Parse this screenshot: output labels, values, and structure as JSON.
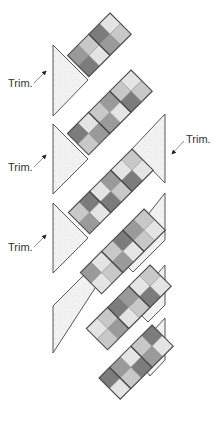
{
  "diagram": {
    "square_step": 10.6,
    "colors": {
      "background": "#ffffff",
      "triangle_fill": "#f1f1f1",
      "triangle_stroke": "#555555",
      "square_stroke": "#4a4a4a",
      "shades": [
        "#e4e4e4",
        "#c8c8c8",
        "#9a9a9a",
        "#7c7c7c"
      ],
      "label": "#333333",
      "arrow": "#333333"
    },
    "pieces": [
      {
        "name": "setting-triangle-left-1",
        "points": [
          [
            53,
            45
          ],
          [
            88,
            80
          ],
          [
            53,
            116
          ]
        ]
      },
      {
        "name": "setting-triangle-left-2",
        "points": [
          [
            53,
            124
          ],
          [
            67,
            138
          ],
          [
            88,
            159
          ],
          [
            53,
            194
          ]
        ]
      },
      {
        "name": "setting-triangle-right-1",
        "points": [
          [
            165,
            114
          ],
          [
            165,
            183
          ],
          [
            132,
            149
          ]
        ]
      },
      {
        "name": "setting-triangle-left-3",
        "points": [
          [
            53,
            203
          ],
          [
            88,
            238
          ],
          [
            53,
            273
          ]
        ]
      },
      {
        "name": "setting-parallelogram-right-2",
        "points": [
          [
            165,
            193
          ],
          [
            165,
            240
          ],
          [
            133,
            272
          ],
          [
            116,
            255
          ]
        ]
      },
      {
        "name": "setting-parallelogram-left-4",
        "points": [
          [
            53,
            306
          ],
          [
            88,
            271
          ],
          [
            99,
            282
          ],
          [
            53,
            353
          ]
        ]
      },
      {
        "name": "setting-parallelogram-right-3",
        "points": [
          [
            165,
            265
          ],
          [
            165,
            305
          ],
          [
            148,
            322
          ],
          [
            131,
            305
          ]
        ]
      },
      {
        "name": "setting-parallelogram-right-4",
        "points": [
          [
            165,
            318
          ],
          [
            165,
            360
          ],
          [
            150,
            376
          ],
          [
            133,
            353
          ]
        ]
      }
    ],
    "strips": [
      {
        "name": "strip-1",
        "top": [
          110,
          13
        ],
        "rows": [
          [
            0,
            1
          ],
          [
            3,
            2
          ],
          [
            1,
            0
          ],
          [
            2,
            3
          ]
        ]
      },
      {
        "name": "strip-2",
        "top": [
          131,
          70
        ],
        "rows": [
          [
            0,
            1
          ],
          [
            1,
            3
          ],
          [
            2,
            0
          ],
          [
            1,
            2
          ],
          [
            0,
            2
          ],
          [
            3,
            1
          ]
        ]
      },
      {
        "name": "strip-3",
        "top": [
          132,
          149
        ],
        "rows": [
          [
            1,
            0
          ],
          [
            0,
            3
          ],
          [
            2,
            1
          ],
          [
            0,
            3
          ],
          [
            3,
            0
          ],
          [
            1,
            2
          ]
        ]
      },
      {
        "name": "strip-4",
        "top": [
          144,
          209
        ],
        "rows": [
          [
            1,
            0
          ],
          [
            2,
            1
          ],
          [
            3,
            0
          ],
          [
            1,
            2
          ],
          [
            0,
            1
          ],
          [
            2,
            0
          ]
        ]
      },
      {
        "name": "strip-5",
        "top": [
          150,
          265
        ],
        "rows": [
          [
            1,
            0
          ],
          [
            0,
            3
          ],
          [
            2,
            1
          ],
          [
            3,
            0
          ],
          [
            1,
            2
          ],
          [
            0,
            1
          ]
        ]
      },
      {
        "name": "strip-6",
        "top": [
          152,
          325
        ],
        "rows": [
          [
            3,
            0
          ],
          [
            1,
            2
          ],
          [
            0,
            3
          ],
          [
            2,
            1
          ],
          [
            3,
            0
          ]
        ]
      }
    ],
    "labels": [
      {
        "name": "trim-label-1",
        "text": "Trim.",
        "x": 8,
        "y": 77,
        "arrow": [
          [
            34,
            83
          ],
          [
            46,
            71
          ]
        ]
      },
      {
        "name": "trim-label-2",
        "text": "Trim.",
        "x": 186,
        "y": 133,
        "arrow": [
          [
            184,
            141
          ],
          [
            172,
            154
          ]
        ]
      },
      {
        "name": "trim-label-3",
        "text": "Trim.",
        "x": 8,
        "y": 161,
        "arrow": [
          [
            34,
            167
          ],
          [
            46,
            155
          ]
        ]
      },
      {
        "name": "trim-label-4",
        "text": "Trim.",
        "x": 8,
        "y": 241,
        "arrow": [
          [
            34,
            247
          ],
          [
            46,
            235
          ]
        ]
      }
    ]
  }
}
